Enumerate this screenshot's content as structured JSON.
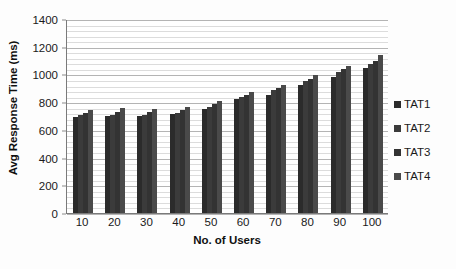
{
  "chart_data": {
    "type": "bar",
    "title": "",
    "subtitle": "",
    "xlabel": "No. of Users",
    "ylabel": "Avg Response Time (ms)",
    "categories": [
      "10",
      "20",
      "30",
      "40",
      "50",
      "60",
      "70",
      "80",
      "90",
      "100"
    ],
    "series": [
      {
        "name": "TAT1",
        "color": "#2b2b2b",
        "values": [
          695,
          700,
          700,
          715,
          750,
          820,
          855,
          925,
          985,
          1045
        ]
      },
      {
        "name": "TAT2",
        "color": "#3b3b3b",
        "values": [
          705,
          710,
          710,
          725,
          765,
          835,
          885,
          950,
          1015,
          1075
        ]
      },
      {
        "name": "TAT3",
        "color": "#333333",
        "values": [
          720,
          730,
          730,
          745,
          790,
          855,
          900,
          970,
          1040,
          1100
        ]
      },
      {
        "name": "TAT4",
        "color": "#4a4a4a",
        "values": [
          740,
          755,
          750,
          765,
          810,
          875,
          925,
          995,
          1060,
          1140
        ]
      }
    ],
    "ylim": [
      0,
      1400
    ],
    "ytick_values": [
      0,
      200,
      400,
      600,
      800,
      1000,
      1200,
      1400
    ],
    "ytick_labels": [
      "0",
      "200",
      "400",
      "600",
      "800",
      "1000",
      "1200",
      "1400"
    ],
    "minor_gridline_step": 40,
    "grid": true,
    "grid_axis": "y",
    "legend_position": "right",
    "legend_entries": [
      "TAT1",
      "TAT2",
      "TAT3",
      "TAT4"
    ],
    "plot_background": "#ffffff",
    "axis_color": "#7a7a7a",
    "major_gridline_color": "#b4b4b4",
    "minor_gridline_color": "#dcdcdc"
  }
}
